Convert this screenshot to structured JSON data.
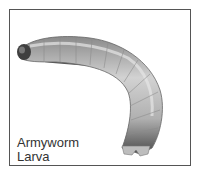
{
  "image": {
    "subject": "caterpillar-illustration",
    "caption_lines": [
      "Armyworm",
      "Larva"
    ],
    "colors": {
      "border": "#555555",
      "body_light": "#c9c9c9",
      "body_mid": "#9a9a9a",
      "body_dark": "#4a4a4a",
      "text": "#333333"
    }
  }
}
